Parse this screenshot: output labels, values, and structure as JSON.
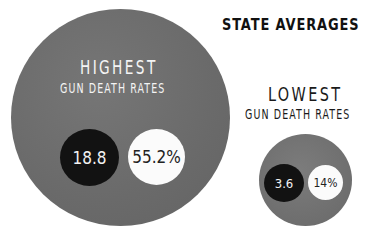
{
  "title": "STATE AVERAGES",
  "groups": {
    "highest": {
      "label_line1": "HIGHEST",
      "label_line2": "GUN DEATH RATES",
      "death_rate": "18.8",
      "percentage": "55.2%"
    },
    "lowest": {
      "label_line1": "LOWEST",
      "label_line2": "GUN DEATH RATES",
      "death_rate": "3.6",
      "percentage": "14%"
    }
  },
  "colors": {
    "outer_circle": "#6e6e6e",
    "rate_circle": "#121212",
    "percent_circle": "#fbfbfb",
    "text_dark": "#111111"
  },
  "chart_data": {
    "type": "bubble",
    "title": "STATE AVERAGES",
    "categories": [
      "Highest gun death rates",
      "Lowest gun death rates"
    ],
    "series": [
      {
        "name": "Gun death rate",
        "values": [
          18.8,
          3.6
        ]
      },
      {
        "name": "Percentage",
        "values": [
          55.2,
          14
        ]
      }
    ],
    "units": {
      "Percentage": "%"
    }
  }
}
